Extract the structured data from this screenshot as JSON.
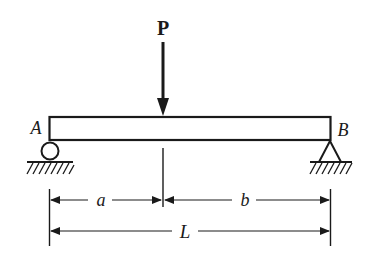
{
  "diagram": {
    "type": "simply-supported-beam",
    "colors": {
      "ink": "#1a1a1a",
      "background": "#ffffff"
    },
    "load": {
      "label": "P",
      "direction": "down",
      "icon": "arrow-down-icon"
    },
    "supports": {
      "left": {
        "label": "A",
        "kind": "roller",
        "icon": "roller-support-icon"
      },
      "right": {
        "label": "B",
        "kind": "pin",
        "icon": "pin-support-icon"
      }
    },
    "dimensions": {
      "a": {
        "label": "a"
      },
      "b": {
        "label": "b"
      },
      "total": {
        "label": "L"
      }
    }
  }
}
